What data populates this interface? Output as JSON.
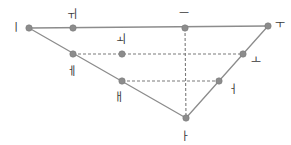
{
  "diagram": {
    "type": "korean-vowel-chart",
    "title": "",
    "width": 291,
    "height": 145,
    "background_color": "#ffffff",
    "colors": {
      "point_fill": "#8c8c8c",
      "point_stroke": "#7a7a7a",
      "solid_line": "#8c8c8c",
      "dashed_line": "#7a7a7a",
      "label_text": "#3a3a3a"
    },
    "style": {
      "solid_line_width": 1.3,
      "dashed_line_width": 1.1,
      "dash_pattern": "3,2",
      "point_radius": 3.2,
      "label_font_size": 11
    },
    "vowels": [
      {
        "id": "i",
        "glyph": "ㅣ",
        "romanization": "i",
        "cx": 29,
        "cy": 28,
        "lx": 16,
        "ly": 27
      },
      {
        "id": "wi",
        "glyph": "ㅟ",
        "romanization": "wi",
        "cx": 73,
        "cy": 28,
        "lx": 72,
        "ly": 14
      },
      {
        "id": "eu",
        "glyph": "ㅡ",
        "romanization": "eu",
        "cx": 185,
        "cy": 28,
        "lx": 184,
        "ly": 13
      },
      {
        "id": "u",
        "glyph": "ㅜ",
        "romanization": "u",
        "cx": 268,
        "cy": 26,
        "lx": 280,
        "ly": 24
      },
      {
        "id": "e",
        "glyph": "ㅔ",
        "romanization": "e",
        "cx": 73,
        "cy": 54,
        "lx": 72,
        "ly": 71
      },
      {
        "id": "oe",
        "glyph": "ㅚ",
        "romanization": "oe",
        "cx": 122,
        "cy": 54,
        "lx": 121,
        "ly": 39
      },
      {
        "id": "o",
        "glyph": "ㅗ",
        "romanization": "o",
        "cx": 243,
        "cy": 54,
        "lx": 256,
        "ly": 60
      },
      {
        "id": "ae",
        "glyph": "ㅐ",
        "romanization": "ae",
        "cx": 122,
        "cy": 81,
        "lx": 119,
        "ly": 97
      },
      {
        "id": "eo",
        "glyph": "ㅓ",
        "romanization": "eo",
        "cx": 219,
        "cy": 81,
        "lx": 233,
        "ly": 89
      },
      {
        "id": "a",
        "glyph": "ㅏ",
        "romanization": "a",
        "cx": 186,
        "cy": 118,
        "lx": 185,
        "ly": 136
      }
    ],
    "solid_lines": [
      {
        "name": "top-edge",
        "x1": 29,
        "y1": 28,
        "x2": 268,
        "y2": 26
      },
      {
        "name": "left-front-edge",
        "x1": 29,
        "y1": 28,
        "x2": 186,
        "y2": 118
      },
      {
        "name": "right-back-edge",
        "x1": 268,
        "y1": 26,
        "x2": 186,
        "y2": 118
      }
    ],
    "dashed_lines": [
      {
        "name": "mid-high-row",
        "x1": 73,
        "y1": 54,
        "x2": 243,
        "y2": 54
      },
      {
        "name": "mid-low-row",
        "x1": 122,
        "y1": 81,
        "x2": 219,
        "y2": 81
      },
      {
        "name": "center-vertical",
        "x1": 185,
        "y1": 28,
        "x2": 186,
        "y2": 118
      }
    ]
  }
}
